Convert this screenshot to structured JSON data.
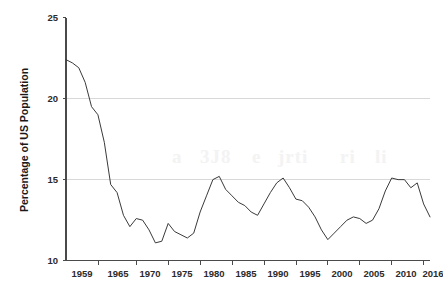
{
  "chart_data": {
    "type": "line",
    "title": "",
    "subtitle": "",
    "xlabel": "",
    "ylabel": "Percentage of US Population",
    "xlim": [
      1959,
      2016
    ],
    "ylim": [
      10,
      25
    ],
    "grid": "horizontal gridlines at 15 and 20 only",
    "legend": "none",
    "y_ticks": [
      "10",
      "15",
      "20",
      "25"
    ],
    "y_tick_values": [
      10,
      15,
      20,
      25
    ],
    "x_ticks": [
      "1959",
      "1965",
      "1970",
      "1975",
      "1980",
      "1985",
      "1990",
      "1995",
      "2000",
      "2005",
      "2010",
      "2016"
    ],
    "x_tick_values": [
      1959,
      1965,
      1970,
      1975,
      1980,
      1985,
      1990,
      1995,
      2000,
      2005,
      2010,
      2016
    ],
    "series": [
      {
        "name": "Percentage of US Population",
        "color": "#3a3a3a",
        "x": [
          1959,
          1960,
          1961,
          1962,
          1963,
          1964,
          1965,
          1966,
          1967,
          1968,
          1969,
          1970,
          1971,
          1972,
          1973,
          1974,
          1975,
          1976,
          1977,
          1978,
          1979,
          1980,
          1981,
          1982,
          1983,
          1984,
          1985,
          1986,
          1987,
          1988,
          1989,
          1990,
          1991,
          1992,
          1993,
          1994,
          1995,
          1996,
          1997,
          1998,
          1999,
          2000,
          2001,
          2002,
          2003,
          2004,
          2005,
          2006,
          2007,
          2008,
          2009,
          2010,
          2011,
          2012,
          2013,
          2014,
          2015,
          2016
        ],
        "values": [
          22.4,
          22.2,
          21.9,
          21.0,
          19.5,
          19.0,
          17.3,
          14.7,
          14.2,
          12.8,
          12.1,
          12.6,
          12.5,
          11.9,
          11.1,
          11.2,
          12.3,
          11.8,
          11.6,
          11.4,
          11.7,
          13.0,
          14.0,
          15.0,
          15.2,
          14.4,
          14.0,
          13.6,
          13.4,
          13.0,
          12.8,
          13.5,
          14.2,
          14.8,
          15.1,
          14.5,
          13.8,
          13.7,
          13.3,
          12.7,
          11.9,
          11.3,
          11.7,
          12.1,
          12.5,
          12.7,
          12.6,
          12.3,
          12.5,
          13.2,
          14.3,
          15.1,
          15.0,
          15.0,
          14.5,
          14.8,
          13.5,
          12.7
        ]
      }
    ]
  },
  "axes": {
    "ylabel": "Percentage of US Population",
    "y_tick_labels": [
      "25",
      "20",
      "15",
      "10"
    ],
    "x_tick_labels": [
      "1959",
      "1965",
      "1970",
      "1975",
      "1980",
      "1985",
      "1990",
      "1995",
      "2000",
      "2005",
      "2010",
      "2016"
    ]
  },
  "colors": {
    "line": "#3a3a3a",
    "axis": "#4a4a4a",
    "grid": "#d4d4d4",
    "background": "#ffffff",
    "text": "#1a1a1a"
  }
}
